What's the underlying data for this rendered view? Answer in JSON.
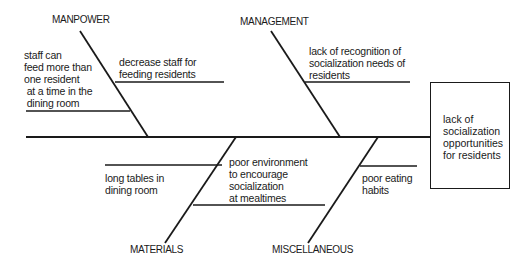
{
  "diagram": {
    "type": "fishbone",
    "effect": "lack of\nsocialization\nopportunities\nfor residents",
    "categories": {
      "manpower": {
        "label": "MANPOWER",
        "causes": [
          "decrease staff for\nfeeding residents",
          "staff can\nfeed more than\none resident\n at a time in the\n dining room"
        ]
      },
      "management": {
        "label": "MANAGEMENT",
        "causes": [
          "lack of recognition of\nsocialization needs of\nresidents"
        ]
      },
      "materials": {
        "label": "MATERIALS",
        "causes": [
          "long tables in\ndining room",
          "poor environment\nto encourage\nsocialization\nat mealtimes"
        ]
      },
      "miscellaneous": {
        "label": "MISCELLANEOUS",
        "causes": [
          "poor eating\nhabits"
        ]
      }
    },
    "colors": {
      "line": "#1a1a1a",
      "background": "#ffffff"
    }
  }
}
